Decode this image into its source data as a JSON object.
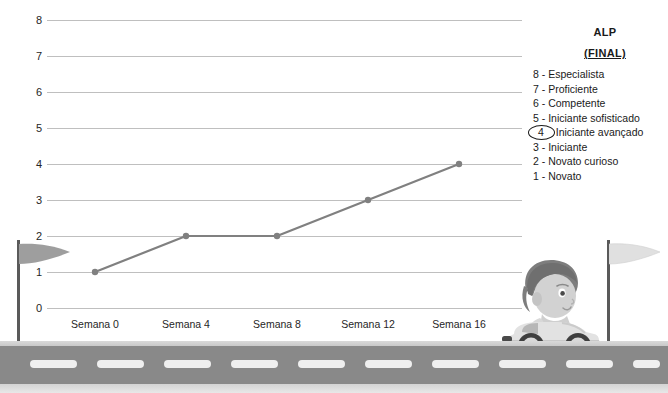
{
  "chart_data": {
    "type": "line",
    "title": "",
    "xlabel": "",
    "ylabel": "",
    "categories": [
      "Semana 0",
      "Semana 4",
      "Semana 8",
      "Semana 12",
      "Semana 16"
    ],
    "values": [
      1,
      2,
      2,
      3,
      4
    ],
    "series": [
      {
        "name": "ALP",
        "values": [
          1,
          2,
          2,
          3,
          4
        ]
      }
    ],
    "yticks": [
      0,
      1,
      2,
      3,
      4,
      5,
      6,
      7,
      8
    ],
    "ylim": [
      0,
      8
    ],
    "grid": true,
    "legend_position": "right",
    "marker": "circle",
    "line_color": "#808080",
    "grid_color": "#bfbfbf"
  },
  "axis": {
    "y_labels": [
      "8",
      "7",
      "6",
      "5",
      "4",
      "3",
      "2",
      "1",
      "0"
    ],
    "x_labels": [
      "Semana 0",
      "Semana 4",
      "Semana 8",
      "Semana 12",
      "Semana 16"
    ]
  },
  "legend": {
    "title": "ALP",
    "subtitle": "(FINAL)",
    "highlighted_level": "4",
    "items": [
      {
        "level": "8 -",
        "label": "Especialista",
        "highlighted": false
      },
      {
        "level": "7 -",
        "label": "Proficiente",
        "highlighted": false
      },
      {
        "level": "6 -",
        "label": "Competente",
        "highlighted": false
      },
      {
        "level": "5 -",
        "label": "Iniciante sofisticado",
        "highlighted": false
      },
      {
        "level": "4",
        "label": "Iniciante avançado",
        "highlighted": true
      },
      {
        "level": "3 -",
        "label": "Iniciante",
        "highlighted": false
      },
      {
        "level": "2 -",
        "label": "Novato curioso",
        "highlighted": false
      },
      {
        "level": "1 -",
        "label": "Novato",
        "highlighted": false
      }
    ]
  },
  "illustration": {
    "left_flag": "start-flag",
    "right_flag": "finish-flag",
    "vehicle": "kid-in-toy-car",
    "road": "asphalt-road-with-dashed-lane-markings"
  },
  "colors": {
    "background": "#ffffff",
    "line": "#808080",
    "grid": "#bfbfbf",
    "text": "#262626",
    "asphalt": "#898989",
    "lane_dash": "#efefef",
    "flag_left": "#9e9e9e",
    "flag_right": "#e3e3e3",
    "pole": "#5a5a5a"
  }
}
